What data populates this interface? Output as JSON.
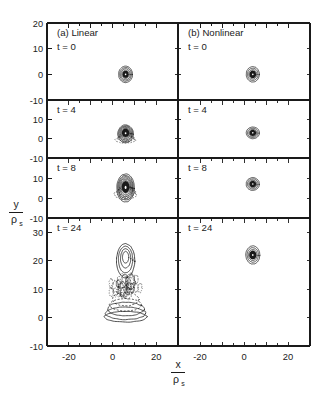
{
  "figure": {
    "background_color": "#ffffff",
    "line_color": "#1a1a1a",
    "axis_titles": {
      "y_numerator": "y",
      "y_denominator_rho": "ρ",
      "y_denominator_sub": "s",
      "x_numerator": "x",
      "x_denominator_rho": "ρ",
      "x_denominator_sub": "s"
    },
    "columns": [
      {
        "key": "linear",
        "label": "(a) Linear"
      },
      {
        "key": "nonlinear",
        "label": "(b) Nonlinear"
      }
    ],
    "rows": [
      {
        "key": "t0",
        "time_label": "t = 0"
      },
      {
        "key": "t4",
        "time_label": "t = 4"
      },
      {
        "key": "t8",
        "time_label": "t = 8"
      },
      {
        "key": "t24",
        "time_label": "t = 24"
      }
    ],
    "x_axis": {
      "label_ticks": [
        -20,
        0,
        20
      ],
      "label_texts": [
        "-20",
        "0",
        "20"
      ],
      "range": [
        -30,
        30
      ],
      "minor_tick_step": 10
    },
    "y_axes": [
      {
        "row": "t0",
        "range": [
          -10,
          20
        ],
        "label_ticks": [
          -10,
          0,
          10,
          20
        ],
        "label_texts": [
          "-10",
          "0",
          "10",
          "20"
        ]
      },
      {
        "row": "t4",
        "range": [
          -10,
          20
        ],
        "label_ticks": [
          -10,
          0,
          10
        ],
        "label_texts": [
          "-10",
          "0",
          "10"
        ]
      },
      {
        "row": "t8",
        "range": [
          -10,
          20
        ],
        "label_ticks": [
          -10,
          0,
          10
        ],
        "label_texts": [
          "-10",
          "0",
          "10"
        ]
      },
      {
        "row": "t24",
        "range": [
          -10,
          35
        ],
        "label_ticks": [
          -10,
          0,
          10,
          20,
          30
        ],
        "label_texts": [
          "-10",
          "0",
          "10",
          "20",
          "30"
        ]
      }
    ]
  },
  "chart_data": {
    "type": "contour",
    "title": "",
    "subtitle": "",
    "xlabel": "x / ρ_s",
    "ylabel": "y / ρ_s",
    "xlim": [
      -30,
      30
    ],
    "grid": false,
    "legend": null,
    "panels": [
      {
        "id": "a-t0",
        "column": "linear",
        "column_label": "(a) Linear",
        "time_label": "t = 0",
        "t": 0,
        "ylim": [
          -10,
          20
        ],
        "blob": {
          "center_x": 6,
          "center_y": 0,
          "rx": 3.2,
          "ry": 3.2,
          "n_contours": 6,
          "filled_core": true,
          "dashed_outer": false,
          "description": "compact nearly circular contour blob"
        }
      },
      {
        "id": "a-t4",
        "column": "linear",
        "column_label": "(a) Linear",
        "time_label": "t = 4",
        "t": 4,
        "ylim": [
          -10,
          20
        ],
        "blob": {
          "center_x": 6,
          "center_y": 2.5,
          "rx": 3.6,
          "ry": 4.6,
          "n_contours": 8,
          "filled_core": true,
          "dashed_outer": true,
          "description": "blob elongating upward with dashed negative lobe below"
        }
      },
      {
        "id": "a-t8",
        "column": "linear",
        "column_label": "(a) Linear",
        "time_label": "t = 8",
        "t": 8,
        "ylim": [
          -10,
          20
        ],
        "blob": {
          "center_x": 6,
          "center_y": 5,
          "rx": 4.0,
          "ry": 7.0,
          "n_contours": 9,
          "filled_core": true,
          "dashed_outer": true,
          "description": "mushroom-shaped nested contours with dark core and dashed skirt"
        }
      },
      {
        "id": "a-t24",
        "column": "linear",
        "column_label": "(a) Linear",
        "time_label": "t = 24",
        "t": 24,
        "ylim": [
          -10,
          35
        ],
        "blob": {
          "center_x": 6,
          "center_y": 12,
          "rx": 9.0,
          "ry": 14.0,
          "n_contours": 12,
          "filled_core": false,
          "dashed_outer": true,
          "description": "large fragmented plume: tall rounded head near y=20 over tangled dashed mid-region and broad open arcs near y=2"
        }
      },
      {
        "id": "b-t0",
        "column": "nonlinear",
        "column_label": "(b) Nonlinear",
        "time_label": "t = 0",
        "t": 0,
        "ylim": [
          -10,
          20
        ],
        "blob": {
          "center_x": 4,
          "center_y": 0,
          "rx": 3.0,
          "ry": 3.0,
          "n_contours": 5,
          "filled_core": true,
          "dashed_outer": false,
          "description": "compact circular blob"
        }
      },
      {
        "id": "b-t4",
        "column": "nonlinear",
        "column_label": "(b) Nonlinear",
        "time_label": "t = 4",
        "t": 4,
        "ylim": [
          -10,
          20
        ],
        "blob": {
          "center_x": 4,
          "center_y": 3,
          "rx": 3.0,
          "ry": 3.0,
          "n_contours": 5,
          "filled_core": true,
          "dashed_outer": false,
          "description": "compact circular blob displaced upward"
        }
      },
      {
        "id": "b-t8",
        "column": "nonlinear",
        "column_label": "(b) Nonlinear",
        "time_label": "t = 8",
        "t": 8,
        "ylim": [
          -10,
          20
        ],
        "blob": {
          "center_x": 4,
          "center_y": 7,
          "rx": 3.0,
          "ry": 3.2,
          "n_contours": 5,
          "filled_core": true,
          "dashed_outer": false,
          "description": "compact circular blob, coherent, moved further up"
        }
      },
      {
        "id": "b-t24",
        "column": "nonlinear",
        "column_label": "(b) Nonlinear",
        "time_label": "t = 24",
        "t": 24,
        "ylim": [
          -10,
          35
        ],
        "blob": {
          "center_x": 4,
          "center_y": 22,
          "rx": 3.2,
          "ry": 3.2,
          "n_contours": 5,
          "filled_core": true,
          "dashed_outer": false,
          "description": "compact coherent blob near y=22, shape preserved"
        }
      }
    ]
  }
}
